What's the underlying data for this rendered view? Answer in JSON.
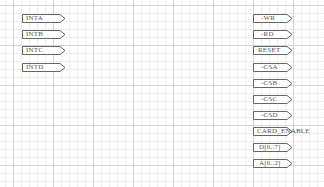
{
  "schematic": {
    "left_ports": [
      {
        "label": "INTA",
        "y": 14
      },
      {
        "label": "INTB",
        "y": 30
      },
      {
        "label": "INTC",
        "y": 46
      },
      {
        "label": "INTD",
        "y": 63
      }
    ],
    "right_ports": [
      {
        "label": "-WR",
        "y": 14
      },
      {
        "label": "-RD",
        "y": 30
      },
      {
        "label": "RESET",
        "y": 46
      },
      {
        "label": "-CSA",
        "y": 63
      },
      {
        "label": "-CSB",
        "y": 79
      },
      {
        "label": "-CSC",
        "y": 95
      },
      {
        "label": "-CSD",
        "y": 111
      },
      {
        "label": "CARD_ENABLE",
        "y": 127
      },
      {
        "label": "D[0..7]",
        "y": 143
      },
      {
        "label": "A[0..2]",
        "y": 159
      }
    ],
    "colors": {
      "port_outline": "#666666",
      "grid_major": "#d4d4d4",
      "grid_minor": "#eeeeee"
    }
  }
}
